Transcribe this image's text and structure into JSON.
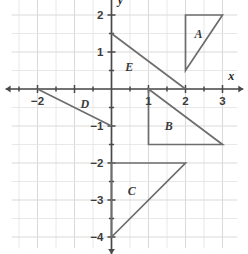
{
  "figure": {
    "type": "coordinate-plane",
    "background_color": "#ffffff",
    "grid_color": "#e2e2e2",
    "axis_color": "#4a4a4a",
    "shape_color": "#6d6d6d",
    "label_color": "#3b3b3b"
  },
  "axes": {
    "x_axis_name": "x",
    "y_axis_name": "y",
    "x_range": [
      -2.7,
      3.4
    ],
    "y_range": [
      -4.3,
      2.5
    ],
    "grid_step": 0.5,
    "tick_step": 0.5,
    "x_tick_labels": [
      {
        "value": -2,
        "text": "−2"
      },
      {
        "value": 1,
        "text": "1"
      },
      {
        "value": 2,
        "text": "2"
      },
      {
        "value": 3,
        "text": "3"
      }
    ],
    "y_tick_labels": [
      {
        "value": 2,
        "text": "2"
      },
      {
        "value": 1,
        "text": "1"
      },
      {
        "value": -1,
        "text": "−1"
      },
      {
        "value": -2,
        "text": "−2"
      },
      {
        "value": -3,
        "text": "−3"
      },
      {
        "value": -4,
        "text": "−4"
      }
    ]
  },
  "chart_data": {
    "type": "scatter",
    "title": "",
    "xlabel": "x",
    "ylabel": "y",
    "xlim": [
      -2.7,
      3.4
    ],
    "ylim": [
      -4.3,
      2.5
    ],
    "grid": true,
    "legend": "none",
    "shapes": [
      {
        "label": "A",
        "kind": "triangle",
        "closed": true,
        "vertices": [
          [
            2,
            2
          ],
          [
            3,
            2
          ],
          [
            2,
            0.5
          ]
        ],
        "label_position": [
          2.35,
          1.5
        ]
      },
      {
        "label": "B",
        "kind": "triangle",
        "closed": true,
        "vertices": [
          [
            1,
            0
          ],
          [
            1,
            -1.5
          ],
          [
            3,
            -1.5
          ]
        ],
        "label_position": [
          1.55,
          -1.0
        ]
      },
      {
        "label": "C",
        "kind": "triangle",
        "closed": true,
        "vertices": [
          [
            0,
            -2
          ],
          [
            2,
            -2
          ],
          [
            0,
            -4
          ]
        ],
        "label_position": [
          0.55,
          -2.75
        ]
      },
      {
        "label": "D",
        "kind": "segment",
        "closed": false,
        "vertices": [
          [
            -2,
            0
          ],
          [
            0,
            -1
          ]
        ],
        "label_position": [
          -0.72,
          -0.4
        ]
      },
      {
        "label": "E",
        "kind": "segment",
        "closed": false,
        "vertices": [
          [
            0,
            1.5
          ],
          [
            2,
            0
          ]
        ],
        "label_position": [
          0.48,
          0.6
        ]
      }
    ]
  }
}
